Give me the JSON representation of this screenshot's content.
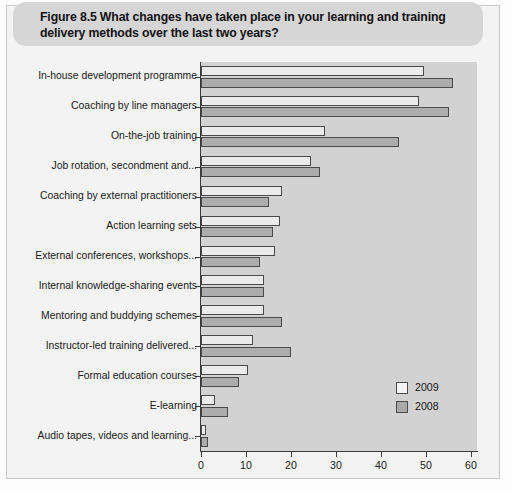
{
  "figure": {
    "number": "Figure 8.5",
    "title": "Figure 8.5  What changes have taken place in your learning and training delivery methods over the last two years?"
  },
  "legend": {
    "position": "bottom-right",
    "entries": [
      {
        "label": "2009",
        "swatch": "legend-swatch-2009",
        "color": "#f4f4f4"
      },
      {
        "label": "2008",
        "swatch": "legend-swatch-2008",
        "color": "#a9a9a9"
      }
    ]
  },
  "axis": {
    "x_ticks": [
      "0",
      "10",
      "20",
      "30",
      "40",
      "50",
      "60"
    ],
    "x_min": 0,
    "x_max": 60
  },
  "colors": {
    "series_2009": "#ebebeb",
    "series_2008": "#acacac",
    "plot_background": "#d2d2d2",
    "banner": "#d6d6d6",
    "frame": "#f3f3f3"
  },
  "chart_data": {
    "type": "bar",
    "orientation": "horizontal",
    "title": "Figure 8.5  What changes have taken place in your learning and training delivery methods over the last two years?",
    "xlabel": "",
    "ylabel": "",
    "xlim": [
      0,
      60
    ],
    "grid": false,
    "legend_position": "bottom-right",
    "categories": [
      "In-house development programme",
      "Coaching by line managers",
      "On-the-job training",
      "Job rotation, secondment and...",
      "Coaching by external practitioners",
      "Action learning sets",
      "External conferences, workshops...",
      "Internal knowledge-sharing events",
      "Mentoring and buddying schemes",
      "Instructor-led training delivered...",
      "Formal education courses",
      "E-learning",
      "Audio tapes, videos and learning..."
    ],
    "series": [
      {
        "name": "2009",
        "values": [
          49.5,
          48.5,
          27.5,
          24.5,
          18,
          17.5,
          16.5,
          14,
          14,
          11.5,
          10.5,
          3,
          1
        ]
      },
      {
        "name": "2008",
        "values": [
          56,
          55,
          44,
          26.5,
          15,
          16,
          13,
          14,
          18,
          20,
          8.5,
          6,
          1.5
        ]
      }
    ]
  }
}
